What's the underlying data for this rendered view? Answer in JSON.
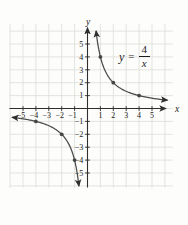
{
  "figure": {
    "background": "#fdfdfc",
    "axis_color": "#2e2e2e",
    "grid_color": "#dadcd5",
    "curve_color": "#4a4a4a",
    "point_color": "#454545",
    "label_color": "#1c1c1c"
  },
  "chart_data": {
    "type": "line",
    "title": "",
    "function": "y = 4/x",
    "coefficient": 4,
    "xlabel": "x",
    "ylabel": "y",
    "x_ticks": [
      -5,
      -4,
      -3,
      -2,
      -1,
      1,
      2,
      3,
      4,
      5
    ],
    "y_ticks": [
      -5,
      -4,
      -3,
      -2,
      -1,
      1,
      2,
      3,
      4,
      5
    ],
    "xlim": [
      -6.05,
      6.6
    ],
    "ylim": [
      -6.15,
      6.55
    ],
    "grid": true,
    "grid_range": {
      "x": [
        -6,
        6
      ],
      "y": [
        -6,
        6
      ]
    },
    "marked_points": [
      [
        1,
        4
      ],
      [
        2,
        2
      ],
      [
        4,
        1
      ],
      [
        -1,
        -4
      ],
      [
        -2,
        -2
      ],
      [
        -4,
        -1
      ]
    ],
    "branches": [
      {
        "name": "first-quadrant-branch",
        "x_from": 0.665,
        "x_to": 6.2
      },
      {
        "name": "third-quadrant-branch",
        "x_from": -5.85,
        "x_to": -0.665
      }
    ],
    "equation_label": {
      "lhs": "y",
      "relation": "=",
      "numerator": "4",
      "denominator": "x"
    }
  }
}
